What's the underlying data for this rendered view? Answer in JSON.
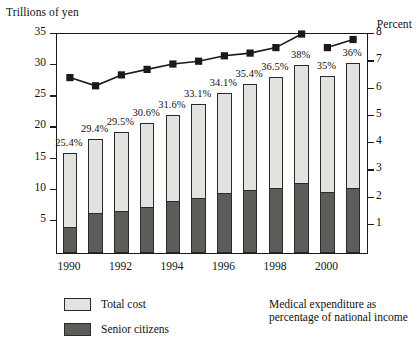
{
  "chart_data": {
    "type": "bar",
    "title": "",
    "subtitle": "",
    "ylabel": "Trillions of yen",
    "ylabel_right": "Percent",
    "xlabel": "",
    "ylim": [
      0,
      35
    ],
    "ylim_right": [
      0,
      8
    ],
    "yticks": [
      5,
      10,
      15,
      20,
      25,
      30,
      35
    ],
    "yticks_right": [
      1,
      2,
      3,
      4,
      5,
      6,
      7,
      8
    ],
    "grid": false,
    "legend_position": "bottom",
    "categories": [
      1990,
      1991,
      1992,
      1993,
      1994,
      1995,
      1996,
      1997,
      1998,
      1999,
      2000,
      2001
    ],
    "xtick_labels": [
      "1990",
      "1992",
      "1994",
      "1996",
      "1998",
      "2000"
    ],
    "xtick_categories": [
      1990,
      1992,
      1994,
      1996,
      1998,
      2000
    ],
    "series": [
      {
        "name": "Total cost",
        "type": "bar-stacked-outer",
        "color": "#e2e2df",
        "values": [
          16.0,
          18.3,
          19.5,
          20.8,
          22.2,
          24.0,
          25.7,
          27.2,
          28.3,
          30.2,
          28.4,
          30.5
        ]
      },
      {
        "name": "Senior citizens",
        "type": "bar-stacked-inner",
        "color": "#5c5c59",
        "values": [
          4.2,
          6.4,
          6.8,
          7.4,
          8.3,
          8.9,
          9.7,
          10.1,
          10.5,
          11.2,
          9.8,
          10.5
        ]
      },
      {
        "name": "Medical expenditure as percentage of national income",
        "type": "line",
        "color": "#1a1a1a",
        "axis": "right",
        "marker": "square",
        "values": [
          6.4,
          6.1,
          6.5,
          6.7,
          6.9,
          7.0,
          7.2,
          7.3,
          7.5,
          8.0,
          7.5,
          7.8
        ],
        "break_after": 1999
      }
    ],
    "bar_labels": [
      "25.4%",
      "29.4%",
      "29.5%",
      "30.6%",
      "31.6%",
      "33.1%",
      "34.1%",
      "35.4%",
      "36.5%",
      "38%",
      "35%",
      "36%"
    ],
    "legend": [
      {
        "label": "Total cost",
        "kind": "swatch-light"
      },
      {
        "label": "Senior citizens",
        "kind": "swatch-dark"
      },
      {
        "label": "Medical expenditure as",
        "label2": "percentage of national income",
        "kind": "line-marker"
      }
    ]
  }
}
